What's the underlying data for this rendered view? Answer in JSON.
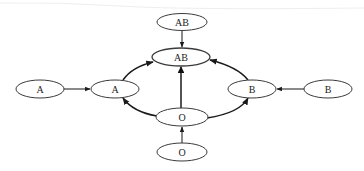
{
  "diagram": {
    "type": "blood-type-compatibility-graph",
    "nodes": [
      {
        "id": "ab_top",
        "label": "AB",
        "cx": 182,
        "cy": 22,
        "rx": 25,
        "ry": 8.5
      },
      {
        "id": "ab_center",
        "label": "AB",
        "cx": 181,
        "cy": 57,
        "rx": 29,
        "ry": 9
      },
      {
        "id": "a_outer",
        "label": "A",
        "cx": 40,
        "cy": 89,
        "rx": 24,
        "ry": 9
      },
      {
        "id": "a_inner",
        "label": "A",
        "cx": 115,
        "cy": 89,
        "rx": 24,
        "ry": 9
      },
      {
        "id": "b_inner",
        "label": "B",
        "cx": 252,
        "cy": 89,
        "rx": 24,
        "ry": 9
      },
      {
        "id": "b_outer",
        "label": "B",
        "cx": 328,
        "cy": 89,
        "rx": 24,
        "ry": 9
      },
      {
        "id": "o_center",
        "label": "O",
        "cx": 182,
        "cy": 117,
        "rx": 26,
        "ry": 9
      },
      {
        "id": "o_bottom",
        "label": "O",
        "cx": 182,
        "cy": 152,
        "rx": 25,
        "ry": 9
      }
    ],
    "edges": [
      {
        "from": "ab_top",
        "to": "ab_center"
      },
      {
        "from": "a_outer",
        "to": "a_inner"
      },
      {
        "from": "b_outer",
        "to": "b_inner"
      },
      {
        "from": "o_bottom",
        "to": "o_center"
      },
      {
        "from": "o_center",
        "to": "ab_center",
        "emphasis": "bold"
      },
      {
        "from": "a_inner",
        "to": "ab_center",
        "curved": true
      },
      {
        "from": "b_inner",
        "to": "ab_center",
        "curved": true
      },
      {
        "from": "o_center",
        "to": "a_inner",
        "curved": true
      },
      {
        "from": "o_center",
        "to": "b_inner",
        "curved": true
      }
    ]
  },
  "labels": {
    "ab_top": "AB",
    "ab_center": "AB",
    "a_outer": "A",
    "a_inner": "A",
    "b_inner": "B",
    "b_outer": "B",
    "o_center": "O",
    "o_bottom": "O"
  }
}
